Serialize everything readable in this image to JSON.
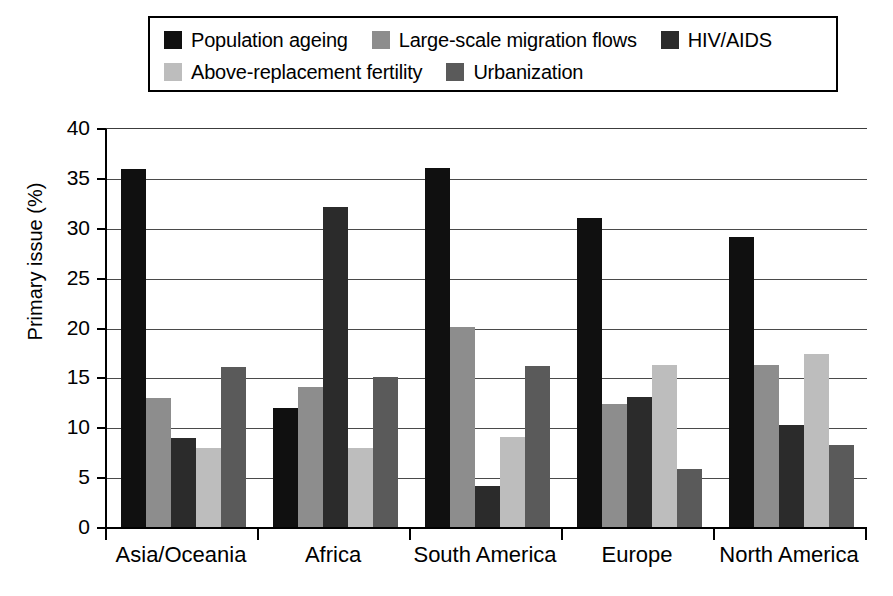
{
  "chart_data": {
    "type": "bar",
    "title": "",
    "xlabel": "",
    "ylabel": "Primary issue (%)",
    "ylim": [
      0,
      40
    ],
    "yticks": [
      0,
      5,
      10,
      15,
      20,
      25,
      30,
      35,
      40
    ],
    "grid": "horizontal",
    "legend_position": "top",
    "categories": [
      "Asia/Oceania",
      "Africa",
      "South America",
      "Europe",
      "North America"
    ],
    "series": [
      {
        "name": "Population ageing",
        "color": "#101010",
        "values": [
          36.0,
          12.0,
          36.1,
          31.1,
          29.2
        ]
      },
      {
        "name": "Large-scale migration flows",
        "color": "#8d8d8d",
        "values": [
          13.0,
          14.1,
          20.2,
          12.4,
          16.3
        ]
      },
      {
        "name": "HIV/AIDS",
        "color": "#2b2b2b",
        "values": [
          9.0,
          32.2,
          4.2,
          13.1,
          10.3
        ]
      },
      {
        "name": "Above-replacement fertility",
        "color": "#bdbdbd",
        "values": [
          8.0,
          8.0,
          9.1,
          16.3,
          17.4
        ]
      },
      {
        "name": "Urbanization",
        "color": "#5a5a5a",
        "values": [
          16.1,
          15.1,
          16.2,
          5.9,
          8.3
        ]
      }
    ]
  },
  "legend": {
    "rows": [
      [
        {
          "label": "Population ageing",
          "color": "#101010",
          "swatch_name": "legend-swatch-population-ageing"
        },
        {
          "label": "Large-scale migration flows",
          "color": "#8d8d8d",
          "swatch_name": "legend-swatch-migration-flows"
        },
        {
          "label": "HIV/AIDS",
          "color": "#2b2b2b",
          "swatch_name": "legend-swatch-hiv-aids"
        }
      ],
      [
        {
          "label": "Above-replacement fertility",
          "color": "#bdbdbd",
          "swatch_name": "legend-swatch-above-replacement-fertility"
        },
        {
          "label": "Urbanization",
          "color": "#5a5a5a",
          "swatch_name": "legend-swatch-urbanization"
        }
      ]
    ]
  },
  "axes": {
    "y_title": "Primary issue (%)",
    "y_ticks": [
      "40",
      "35",
      "30",
      "25",
      "20",
      "15",
      "10",
      "5",
      "0"
    ],
    "x_categories": [
      "Asia/Oceania",
      "Africa",
      "South America",
      "Europe",
      "North America"
    ]
  }
}
